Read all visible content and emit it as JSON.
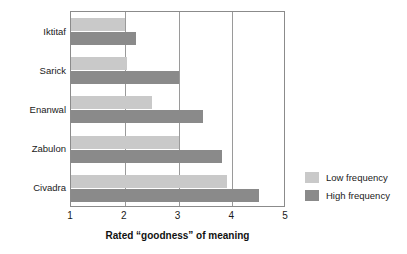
{
  "chart_data": {
    "type": "bar",
    "orientation": "horizontal",
    "title": "",
    "xlabel": "Rated “goodness” of meaning",
    "ylabel": "",
    "categories": [
      "Iktitaf",
      "Sarick",
      "Enanwal",
      "Zabulon",
      "Civadra"
    ],
    "series": [
      {
        "name": "Low frequency",
        "color": "#c9c9c9",
        "values": [
          2.0,
          2.05,
          2.5,
          3.0,
          3.9
        ]
      },
      {
        "name": "High frequency",
        "color": "#8a8a8a",
        "values": [
          2.2,
          3.0,
          3.45,
          3.8,
          4.5
        ]
      }
    ],
    "xlim": [
      1,
      5
    ],
    "xticks": [
      1,
      2,
      3,
      4,
      5
    ],
    "xtick_labels": [
      "1",
      "2",
      "3",
      "4",
      "5"
    ],
    "grid": true,
    "grid_axis": "x",
    "legend_position": "right",
    "legend_entries": [
      "Low frequency",
      "High frequency"
    ]
  }
}
